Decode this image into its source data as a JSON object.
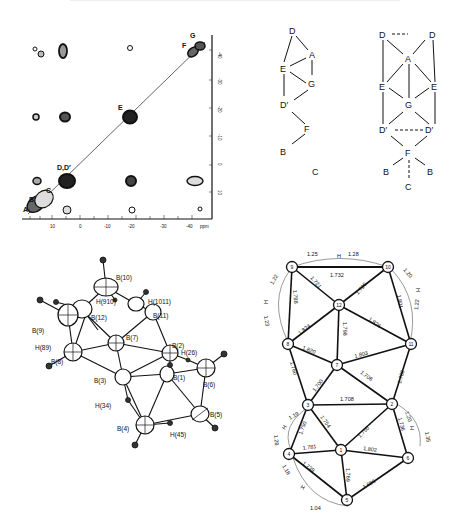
{
  "nmr_spectrum": {
    "type": "2D COSY",
    "x_axis": {
      "ticks": [
        "10",
        "0",
        "-10",
        "-20",
        "-30",
        "-40"
      ],
      "unit": "ppm"
    },
    "y_axis": {
      "ticks": [
        "-40",
        "-30",
        "-20",
        "-10",
        "0",
        "10"
      ]
    },
    "diagonal_labels": [
      "A",
      "B",
      "C",
      "D,D′",
      "E",
      "F",
      "G"
    ]
  },
  "connectivity_left": {
    "nodes": [
      "D",
      "A",
      "E",
      "G",
      "D′",
      "F",
      "B"
    ],
    "caption": "C"
  },
  "connectivity_right": {
    "nodes": [
      "D",
      "D",
      "A",
      "E",
      "E",
      "G",
      "D′",
      "D′",
      "F",
      "B",
      "B",
      "C"
    ]
  },
  "ortep": {
    "labels": [
      "B(10)",
      "H(1011)",
      "H(910)",
      "B(11)",
      "B(12)",
      "B(9)",
      "H(89)",
      "B(8)",
      "B(7)",
      "B(2)",
      "H(26)",
      "B(6)",
      "B(3)",
      "B(1)",
      "H(34)",
      "B(4)",
      "B(5)",
      "H(45)"
    ]
  },
  "schematic": {
    "nodes": [
      "9",
      "10",
      "12",
      "8",
      "11",
      "7",
      "3",
      "2",
      "4",
      "1",
      "6",
      "5"
    ],
    "bonds": {
      "b9_10": "1.732",
      "b9_12": "1.721",
      "b10_12": "1.726",
      "b9_8": "1.788",
      "b10_11": "1.801",
      "b8_12": "1.824",
      "b12_11": "1.826",
      "b12_7": "1.798",
      "b8_7": "1.820",
      "b7_11": "1.803",
      "b8_3": "1.760",
      "b11_2": "1.788",
      "b7_3": "1.700",
      "b7_2": "1.706",
      "b3_2": "1.708",
      "b3_4": "1.750",
      "b3_1": "1.754",
      "b2_1": "1.755",
      "b2_6": "1.736",
      "b4_1": "1.781",
      "b1_6": "1.802",
      "b4_5": "1.739",
      "b1_5": "1.769",
      "b6_5": "1.686"
    },
    "bridges": {
      "h_top_left": "1.25",
      "h_top_right": "1.28",
      "h_9_8_a": "1.22",
      "h_9_8_b": "1.23",
      "h_10_11_a": "1.20",
      "h_10_11_b": "1.22",
      "h_3_4_a": "1.19",
      "h_3_4_b": "1.28",
      "h_2_6_a": "1.20",
      "h_2_6_b": "1.35",
      "h_4_5_a": "1.18",
      "h_4_5_b": "1.04"
    },
    "h_label": "H"
  }
}
